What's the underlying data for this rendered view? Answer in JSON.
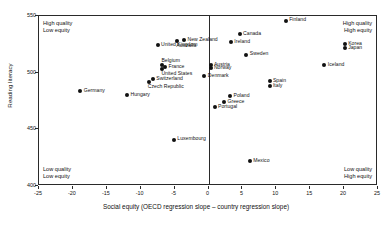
{
  "chart_data": {
    "type": "scatter",
    "title": "",
    "xlabel": "Social equity (OECD regression slope – country regression slope)",
    "ylabel": "Reading literacy",
    "xlim": [
      -25,
      25
    ],
    "ylim": [
      400,
      550
    ],
    "xticks": [
      -25,
      -20,
      -15,
      -10,
      -5,
      0,
      5,
      10,
      15,
      20,
      25
    ],
    "yticks": [
      400,
      450,
      500,
      550
    ],
    "grid": false,
    "legend": null,
    "reference_lines": [
      {
        "axis": "x",
        "value": 0
      }
    ],
    "points": [
      {
        "label": "Finland",
        "x": 11.4,
        "y": 546,
        "label_pos": "right"
      },
      {
        "label": "Canada",
        "x": 4.6,
        "y": 534,
        "label_pos": "right"
      },
      {
        "label": "New Zealand",
        "x": -3.6,
        "y": 529,
        "label_pos": "right"
      },
      {
        "label": "Ireland",
        "x": 3.3,
        "y": 527,
        "label_pos": "right"
      },
      {
        "label": "Australia",
        "x": -4.6,
        "y": 528,
        "label_pos": "below"
      },
      {
        "label": "Korea",
        "x": 20.1,
        "y": 525,
        "label_pos": "right"
      },
      {
        "label": "United Kingdom",
        "x": -7.5,
        "y": 524,
        "label_pos": "right"
      },
      {
        "label": "Japan",
        "x": 20.1,
        "y": 522,
        "label_pos": "right"
      },
      {
        "label": "Sweden",
        "x": 5.6,
        "y": 516,
        "label_pos": "right"
      },
      {
        "label": "Belgium",
        "x": -6.8,
        "y": 507,
        "label_pos": "above"
      },
      {
        "label": "Austria",
        "x": 0.3,
        "y": 507,
        "label_pos": "right"
      },
      {
        "label": "Iceland",
        "x": 17.1,
        "y": 507,
        "label_pos": "right"
      },
      {
        "label": "France",
        "x": -6.4,
        "y": 505,
        "label_pos": "right"
      },
      {
        "label": "Norway",
        "x": 0.3,
        "y": 504,
        "label_pos": "right"
      },
      {
        "label": "United States",
        "x": -6.8,
        "y": 503,
        "label_pos": "below"
      },
      {
        "label": "Denmark",
        "x": -0.6,
        "y": 497,
        "label_pos": "right"
      },
      {
        "label": "Switzerland",
        "x": -8.2,
        "y": 494,
        "label_pos": "right"
      },
      {
        "label": "Spain",
        "x": 9.0,
        "y": 493,
        "label_pos": "right"
      },
      {
        "label": "Czech Republic",
        "x": -8.8,
        "y": 492,
        "label_pos": "below"
      },
      {
        "label": "Italy",
        "x": 9.0,
        "y": 488,
        "label_pos": "right"
      },
      {
        "label": "Germany",
        "x": -18.9,
        "y": 484,
        "label_pos": "right"
      },
      {
        "label": "Poland",
        "x": 3.2,
        "y": 479,
        "label_pos": "right"
      },
      {
        "label": "Hungary",
        "x": -12.0,
        "y": 480,
        "label_pos": "right"
      },
      {
        "label": "Greece",
        "x": 2.3,
        "y": 474,
        "label_pos": "right"
      },
      {
        "label": "Portugal",
        "x": 0.9,
        "y": 470,
        "label_pos": "right"
      },
      {
        "label": "Luxembourg",
        "x": -5.1,
        "y": 441,
        "label_pos": "right"
      },
      {
        "label": "Mexico",
        "x": 6.1,
        "y": 422,
        "label_pos": "right"
      }
    ],
    "quadrant_notes": {
      "top_left": {
        "line1": "High quality",
        "line2": "Low equity"
      },
      "top_right": {
        "line1": "High quality",
        "line2": "High equity"
      },
      "bottom_left": {
        "line1": "Low quality",
        "line2": "Low equity"
      },
      "bottom_right": {
        "line1": "Low quality",
        "line2": "High equity"
      }
    }
  },
  "colors": {
    "marker": "#111111",
    "axis": "#2a2a2a",
    "background": "#ffffff",
    "text": "#111111"
  }
}
